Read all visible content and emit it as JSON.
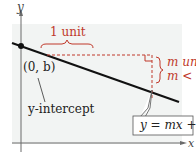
{
  "diagram": {
    "axes": {
      "x_label": "x",
      "y_label": "y"
    },
    "line": {
      "equation_label": "y = mx + b"
    },
    "intercept": {
      "point_label": "(0, b)",
      "caption": "y-intercept"
    },
    "slope": {
      "run_label": "1 unit",
      "rise_label_line1": "m units,",
      "rise_label_line2": "m < 0"
    },
    "colors": {
      "background": "#ffffff",
      "plot_area": "#f2f4f3",
      "axis": "#6b6b6b",
      "line": "#111111",
      "accent": "#c0392b"
    }
  }
}
